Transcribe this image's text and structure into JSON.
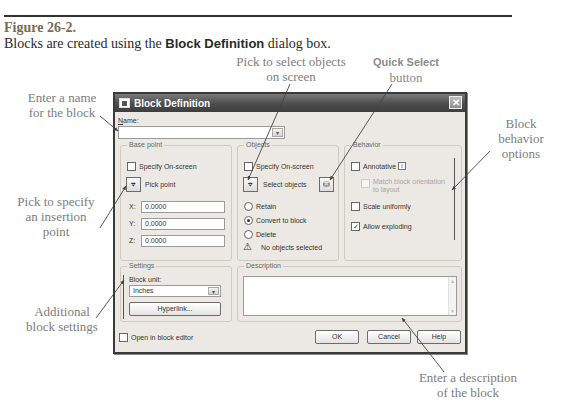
{
  "figure": {
    "number": "Figure 26-2.",
    "caption_pre": "Blocks are created using the ",
    "caption_bold": "Block Definition",
    "caption_post": " dialog box."
  },
  "callouts": {
    "name": [
      "Enter a name",
      "for the block"
    ],
    "pick_point": [
      "Pick to specify",
      "an insertion",
      "point"
    ],
    "settings": [
      "Additional",
      "block settings"
    ],
    "select_objects": [
      "Pick to select objects",
      "on screen"
    ],
    "quick_select": {
      "title": "Quick Select",
      "sub": "button"
    },
    "behavior": [
      "Block",
      "behavior",
      "options"
    ],
    "description": [
      "Enter a description",
      "of the block"
    ]
  },
  "dialog": {
    "title": "Block Definition",
    "close_glyph": "✕",
    "name": {
      "label": "Name:",
      "value": "",
      "arrow": "▾"
    },
    "base_point": {
      "title": "Base point",
      "specify_on_screen": "Specify On-screen",
      "pick_point": "Pick point",
      "pick_icon": "⌖",
      "x_label": "X:",
      "x_value": "0.0000",
      "y_label": "Y:",
      "y_value": "0.0000",
      "z_label": "Z:",
      "z_value": "0.0000"
    },
    "objects": {
      "title": "Objects",
      "specify_on_screen": "Specify On-screen",
      "select_objects": "Select objects",
      "select_icon": "⌖",
      "quick_select_icon": "⛁",
      "retain": "Retain",
      "convert": "Convert to block",
      "delete": "Delete",
      "selected_option": "convert",
      "status_icon": "⚠",
      "status": "No objects selected"
    },
    "behavior": {
      "title": "Behavior",
      "annotative": "Annotative",
      "annotative_info": "i",
      "annotative_checked": false,
      "match_orientation": [
        "Match block orientation",
        "to layout"
      ],
      "scale_uniformly": "Scale uniformly",
      "scale_checked": false,
      "allow_exploding": "Allow exploding",
      "exploding_checked": true,
      "check_glyph": "✓"
    },
    "settings": {
      "title": "Settings",
      "block_unit_label": "Block unit:",
      "block_unit_value": "Inches",
      "arrow": "▾",
      "hyperlink": "Hyperlink..."
    },
    "description": {
      "title": "Description",
      "value": ""
    },
    "footer": {
      "open_in_editor": "Open in block editor",
      "ok": "OK",
      "cancel": "Cancel",
      "help": "Help"
    }
  }
}
